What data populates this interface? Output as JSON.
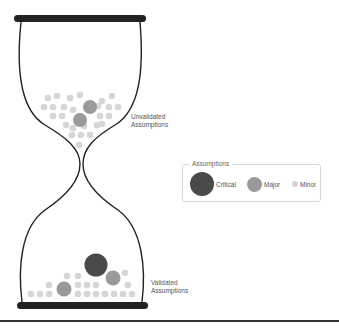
{
  "diagram": {
    "labels": {
      "top": [
        "Unvalidated",
        "Assumptions"
      ],
      "bottom": [
        "Validated",
        "Assumptions"
      ]
    },
    "legend": {
      "title": "Assumptions",
      "items": [
        {
          "label": "Critical",
          "color": "#4a4a4a",
          "size": "large"
        },
        {
          "label": "Major",
          "color": "#9a9a9a",
          "size": "medium"
        },
        {
          "label": "Minor",
          "color": "#d6d6d6",
          "size": "small"
        }
      ]
    },
    "colors": {
      "frame": "#222222",
      "critical": "#4a4a4a",
      "major": "#9a9a9a",
      "minor": "#d6d6d6"
    },
    "top_chamber": {
      "critical_count": 0,
      "major_count": 2,
      "minor_count": 30
    },
    "bottom_chamber": {
      "critical_count": 1,
      "major_count": 2,
      "minor_count": 22
    }
  }
}
